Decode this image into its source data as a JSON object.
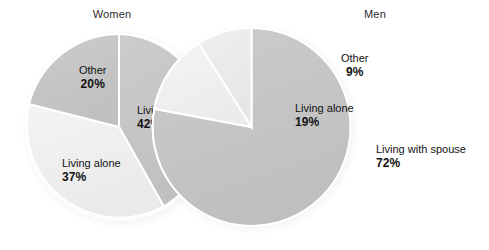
{
  "chart_data": [
    {
      "type": "pie",
      "title": "Women",
      "categories": [
        "Living with spouse",
        "Living alone",
        "Other"
      ],
      "values": [
        42,
        37,
        20
      ],
      "value_labels": [
        "42%",
        "37%",
        "20%"
      ],
      "colors": [
        "#c6c6c6",
        "#f1f1f1",
        "#c6c6c6"
      ],
      "start_angle_deg": 0,
      "direction": "clockwise",
      "units": "percent",
      "legend": "none",
      "grid": false,
      "center": {
        "x": 119,
        "y": 127
      },
      "radius": 93
    },
    {
      "type": "pie",
      "title": "Men",
      "categories": [
        "Living with spouse",
        "Living alone",
        "Other"
      ],
      "values": [
        72,
        19,
        9
      ],
      "value_labels": [
        "72%",
        "19%",
        "9%"
      ],
      "colors": [
        "#c6c6c6",
        "#f1f1f1",
        "#eaeaea"
      ],
      "start_angle_deg": 0,
      "direction": "clockwise",
      "units": "percent",
      "legend": "none",
      "grid": false,
      "center": {
        "x": 374,
        "y": 127
      },
      "radius": 99
    }
  ],
  "figure": {
    "background": "#ffffff",
    "label_color": "#121212",
    "title_color": "#2b2b2b",
    "slice_outline": "#ffffff"
  },
  "women": {
    "title": "Women",
    "spouse": {
      "name": "Living with spouse",
      "pct": "42%"
    },
    "alone": {
      "name": "Living alone",
      "pct": "37%"
    },
    "other": {
      "name": "Other",
      "pct": "20%"
    }
  },
  "men": {
    "title": "Men",
    "spouse": {
      "name": "Living with spouse",
      "pct": "72%"
    },
    "alone": {
      "name": "Living alone",
      "pct": "19%"
    },
    "other": {
      "name": "Other",
      "pct": "9%"
    }
  }
}
